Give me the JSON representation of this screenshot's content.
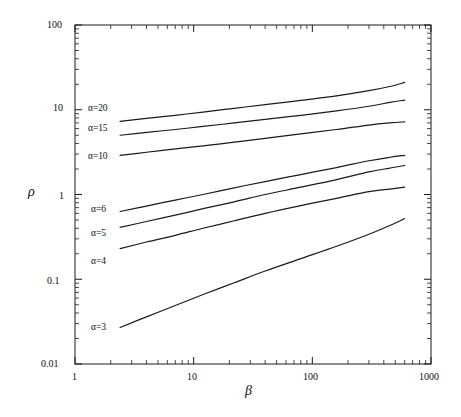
{
  "chart_data": {
    "type": "line",
    "title": "",
    "xlabel": "β",
    "ylabel": "ρ",
    "xscale": "log",
    "yscale": "log",
    "xlim": [
      1,
      1000
    ],
    "ylim": [
      0.01,
      100
    ],
    "grid": false,
    "legend_position": "inline-left-of-curves",
    "xticks": [
      "1",
      "10",
      "100",
      "1000"
    ],
    "xtick_values": [
      1,
      10,
      100,
      1000
    ],
    "yticks": [
      "0.01",
      "0.1",
      "1",
      "10",
      "100"
    ],
    "ytick_values": [
      0.01,
      0.1,
      1,
      10,
      100
    ],
    "series": [
      {
        "name": "α=20",
        "label": "α=20",
        "x": [
          2.4,
          4,
          7,
          12,
          22,
          40,
          80,
          160,
          300,
          450,
          600
        ],
        "y": [
          7.3,
          7.9,
          8.6,
          9.4,
          10.4,
          11.5,
          12.9,
          14.6,
          16.8,
          18.8,
          21.0
        ]
      },
      {
        "name": "α=15",
        "label": "α=15",
        "x": [
          2.4,
          4,
          7,
          12,
          22,
          40,
          80,
          160,
          300,
          450,
          600
        ],
        "y": [
          5.0,
          5.4,
          5.85,
          6.35,
          7.0,
          7.7,
          8.6,
          9.7,
          11.0,
          12.2,
          13.0
        ]
      },
      {
        "name": "α=10",
        "label": "α=10",
        "x": [
          2.4,
          4,
          7,
          12,
          22,
          40,
          80,
          160,
          300,
          450,
          600
        ],
        "y": [
          2.9,
          3.15,
          3.45,
          3.75,
          4.15,
          4.6,
          5.2,
          5.85,
          6.6,
          7.0,
          7.2
        ]
      },
      {
        "name": "α=6",
        "label": "α=6",
        "x": [
          2.4,
          4,
          7,
          12,
          22,
          40,
          80,
          160,
          300,
          450,
          600
        ],
        "y": [
          0.63,
          0.73,
          0.86,
          1.0,
          1.2,
          1.42,
          1.72,
          2.08,
          2.5,
          2.75,
          2.9
        ]
      },
      {
        "name": "α=5",
        "label": "α=5",
        "x": [
          2.4,
          4,
          7,
          12,
          22,
          40,
          80,
          160,
          300,
          450,
          600
        ],
        "y": [
          0.41,
          0.48,
          0.57,
          0.68,
          0.82,
          1.0,
          1.22,
          1.5,
          1.85,
          2.05,
          2.2
        ]
      },
      {
        "name": "α=4",
        "label": "α=4",
        "x": [
          2.4,
          4,
          7,
          12,
          22,
          40,
          80,
          160,
          300,
          450,
          600
        ],
        "y": [
          0.23,
          0.275,
          0.33,
          0.4,
          0.49,
          0.6,
          0.74,
          0.9,
          1.08,
          1.16,
          1.22
        ]
      },
      {
        "name": "α=3",
        "label": "α=3",
        "x": [
          2.4,
          4,
          7,
          12,
          22,
          40,
          80,
          160,
          300,
          450,
          600
        ],
        "y": [
          0.027,
          0.036,
          0.049,
          0.066,
          0.091,
          0.125,
          0.175,
          0.245,
          0.34,
          0.43,
          0.52
        ]
      }
    ],
    "line_color": "#1a1a1a",
    "axis_color": "#1a1a1a",
    "background": "#ffffff"
  },
  "labels": {
    "y_axis_title": "ρ",
    "x_axis_title": "β",
    "y_100": "100",
    "y_10": "10",
    "y_1": "1",
    "y_01": "0.1",
    "y_001": "0.01",
    "x_1": "1",
    "x_10": "10",
    "x_100": "100",
    "x_1000": "1000",
    "s_a20": "α=20",
    "s_a15": "α=15",
    "s_a10": "α=10",
    "s_a6": "α=6",
    "s_a5": "α=5",
    "s_a4": "α=4",
    "s_a3": "α=3"
  }
}
